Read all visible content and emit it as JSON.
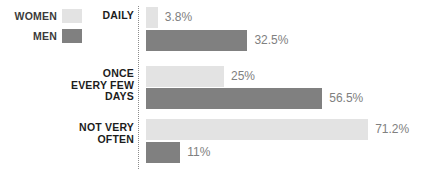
{
  "chart_data": {
    "type": "bar",
    "orientation": "horizontal",
    "title": "",
    "subtitle": "",
    "xlabel": "",
    "ylabel": "",
    "grid": false,
    "axis_style": "dotted-vertical-baseline",
    "legend_position": "top-left",
    "xlim": [
      0,
      71.2
    ],
    "px_per_percent": 3.12,
    "categories": [
      "DAILY",
      "ONCE\nEVERY FEW\nDAYS",
      "NOT VERY\nOFTEN"
    ],
    "series": [
      {
        "name": "WOMEN",
        "color": "#e3e3e3",
        "values": [
          3.8,
          25,
          71.2
        ],
        "labels": [
          "3.8%",
          "25%",
          "71.2%"
        ]
      },
      {
        "name": "MEN",
        "color": "#808080",
        "values": [
          32.5,
          56.5,
          11
        ],
        "labels": [
          "32.5%",
          "56.5%",
          "11%"
        ]
      }
    ]
  },
  "legend": {
    "items": [
      {
        "label": "WOMEN",
        "color": "#e3e3e3"
      },
      {
        "label": "MEN",
        "color": "#808080"
      }
    ]
  },
  "colors": {
    "women": "#e3e3e3",
    "men": "#808080",
    "value_text": "#808080",
    "category_text": "#1c1c1c",
    "legend_text": "#3b3b3b",
    "axis": "#8c8c8c",
    "background": "#ffffff"
  }
}
